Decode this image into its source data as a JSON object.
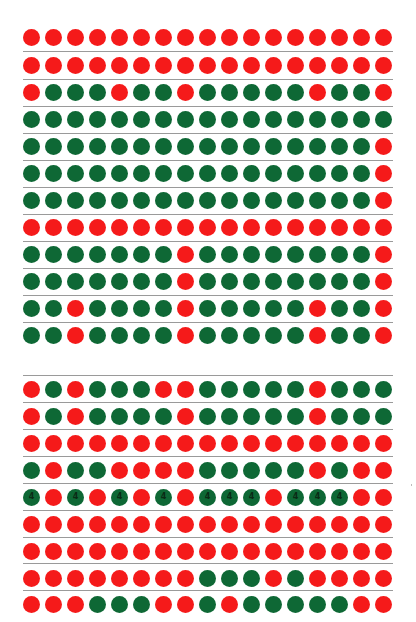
{
  "header": {
    "text": ""
  },
  "colors": {
    "red": "#f51a1a",
    "green": "#0e6835",
    "rule": "#9a9a9a"
  },
  "layout": {
    "dot_x0": 23,
    "dot_pitch": 22,
    "dot_size": 17
  },
  "sections": [
    {
      "name": "grid-top",
      "top_rule": false,
      "row_centers": [
        37,
        65,
        92,
        119,
        146,
        173,
        200,
        227,
        254,
        281,
        308,
        335
      ],
      "rules": [
        51,
        79,
        106,
        133,
        160,
        187,
        214,
        241,
        268,
        295,
        322
      ],
      "rows": [
        [
          "R",
          "R",
          "R",
          "R",
          "R",
          "R",
          "R",
          "R",
          "R",
          "R",
          "R",
          "R",
          "R",
          "R",
          "R",
          "R",
          "R"
        ],
        [
          "R",
          "R",
          "R",
          "R",
          "R",
          "R",
          "R",
          "R",
          "R",
          "R",
          "R",
          "R",
          "R",
          "R",
          "R",
          "R",
          "R"
        ],
        [
          "R",
          "G",
          "G",
          "G",
          "R",
          "G",
          "G",
          "R",
          "G",
          "G",
          "G",
          "G",
          "G",
          "R",
          "G",
          "G",
          "R"
        ],
        [
          "G",
          "G",
          "G",
          "G",
          "G",
          "G",
          "G",
          "G",
          "G",
          "G",
          "G",
          "G",
          "G",
          "G",
          "G",
          "G",
          "G"
        ],
        [
          "G",
          "G",
          "G",
          "G",
          "G",
          "G",
          "G",
          "G",
          "G",
          "G",
          "G",
          "G",
          "G",
          "G",
          "G",
          "G",
          "R"
        ],
        [
          "G",
          "G",
          "G",
          "G",
          "G",
          "G",
          "G",
          "G",
          "G",
          "G",
          "G",
          "G",
          "G",
          "G",
          "G",
          "G",
          "R"
        ],
        [
          "G",
          "G",
          "G",
          "G",
          "G",
          "G",
          "G",
          "G",
          "G",
          "G",
          "G",
          "G",
          "G",
          "G",
          "G",
          "G",
          "R"
        ],
        [
          "R",
          "R",
          "R",
          "R",
          "R",
          "R",
          "R",
          "R",
          "R",
          "R",
          "R",
          "R",
          "R",
          "R",
          "R",
          "R",
          "R"
        ],
        [
          "G",
          "G",
          "G",
          "G",
          "G",
          "G",
          "G",
          "R",
          "G",
          "G",
          "G",
          "G",
          "G",
          "G",
          "G",
          "G",
          "R"
        ],
        [
          "G",
          "G",
          "G",
          "G",
          "G",
          "G",
          "G",
          "R",
          "G",
          "G",
          "G",
          "G",
          "G",
          "G",
          "G",
          "G",
          "R"
        ],
        [
          "G",
          "G",
          "R",
          "G",
          "G",
          "G",
          "G",
          "R",
          "G",
          "G",
          "G",
          "G",
          "G",
          "R",
          "G",
          "G",
          "R"
        ],
        [
          "G",
          "G",
          "R",
          "G",
          "G",
          "G",
          "G",
          "R",
          "G",
          "G",
          "G",
          "G",
          "G",
          "R",
          "G",
          "G",
          "R"
        ]
      ]
    },
    {
      "name": "grid-bottom",
      "top_rule": true,
      "row_centers": [
        389,
        416,
        443,
        470,
        497,
        524,
        551,
        578,
        604
      ],
      "rules": [
        375,
        402,
        429,
        456,
        483,
        510,
        537,
        563,
        590
      ],
      "rows": [
        [
          "R",
          "G",
          "R",
          "G",
          "G",
          "G",
          "R",
          "R",
          "G",
          "G",
          "G",
          "G",
          "G",
          "R",
          "G",
          "G",
          "G"
        ],
        [
          "R",
          "G",
          "R",
          "G",
          "G",
          "G",
          "G",
          "R",
          "G",
          "G",
          "G",
          "G",
          "G",
          "R",
          "G",
          "G",
          "G"
        ],
        [
          "R",
          "R",
          "R",
          "R",
          "R",
          "R",
          "R",
          "R",
          "R",
          "R",
          "R",
          "R",
          "R",
          "R",
          "R",
          "R",
          "R"
        ],
        [
          "G",
          "R",
          "G",
          "G",
          "R",
          "R",
          "R",
          "R",
          "G",
          "G",
          "G",
          "G",
          "G",
          "R",
          "G",
          "R",
          "R"
        ],
        [
          "G4",
          "R",
          "G4",
          "R",
          "G4",
          "R",
          "G4",
          "R",
          "G4",
          "G4",
          "G4",
          "R",
          "G4",
          "G4",
          "G4",
          "R",
          "R"
        ],
        [
          "R",
          "R",
          "R",
          "R",
          "R",
          "R",
          "R",
          "R",
          "R",
          "R",
          "R",
          "R",
          "R",
          "R",
          "R",
          "R",
          "R"
        ],
        [
          "R",
          "R",
          "R",
          "R",
          "R",
          "R",
          "R",
          "R",
          "R",
          "R",
          "R",
          "R",
          "R",
          "R",
          "R",
          "R",
          "R"
        ],
        [
          "R",
          "R",
          "R",
          "R",
          "R",
          "R",
          "R",
          "R",
          "G",
          "G",
          "G",
          "R",
          "G",
          "R",
          "R",
          "R",
          "R"
        ],
        [
          "R",
          "R",
          "R",
          "G",
          "G",
          "G",
          "R",
          "R",
          "G",
          "R",
          "G",
          "G",
          "G",
          "G",
          "G",
          "R",
          "R"
        ]
      ]
    }
  ],
  "dot_label": "4"
}
